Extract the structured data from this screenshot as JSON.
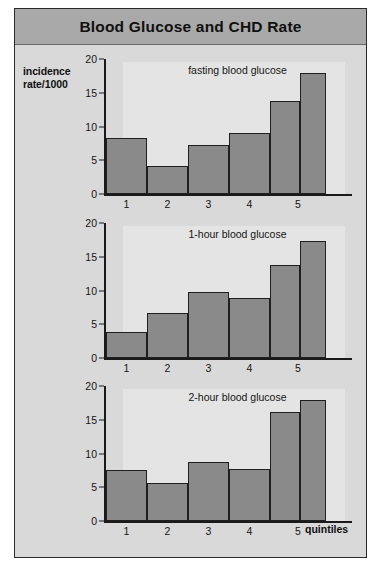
{
  "header": {
    "title": "Blood Glucose and CHD Rate"
  },
  "axis": {
    "y_label_line1": "incidence",
    "y_label_line2": "rate/1000",
    "x_label": "quintiles"
  },
  "chart_data": [
    {
      "type": "bar",
      "title": "fasting blood glucose",
      "categories": [
        "1",
        "2",
        "3",
        "4",
        "5a",
        "5b"
      ],
      "tick_labels": [
        "1",
        "2",
        "3",
        "4",
        "5"
      ],
      "values": [
        8.3,
        4.1,
        7.2,
        9.1,
        13.8,
        17.9
      ],
      "xlabel": "quintiles",
      "ylabel": "incidence rate/1000",
      "ylim": [
        0,
        20
      ],
      "yticks": [
        0,
        5,
        10,
        15,
        20
      ],
      "grid": false,
      "legend": "none"
    },
    {
      "type": "bar",
      "title": "1-hour blood glucose",
      "categories": [
        "1",
        "2",
        "3",
        "4",
        "5a",
        "5b"
      ],
      "tick_labels": [
        "1",
        "2",
        "3",
        "4",
        "5"
      ],
      "values": [
        3.9,
        6.6,
        9.8,
        8.9,
        13.8,
        17.3
      ],
      "xlabel": "quintiles",
      "ylabel": "incidence rate/1000",
      "ylim": [
        0,
        20
      ],
      "yticks": [
        0,
        5,
        10,
        15,
        20
      ],
      "grid": false,
      "legend": "none"
    },
    {
      "type": "bar",
      "title": "2-hour blood glucose",
      "categories": [
        "1",
        "2",
        "3",
        "4",
        "5a",
        "5b"
      ],
      "tick_labels": [
        "1",
        "2",
        "3",
        "4",
        "5"
      ],
      "values": [
        7.5,
        5.6,
        8.7,
        7.7,
        16.2,
        18.0
      ],
      "xlabel": "quintiles",
      "ylabel": "incidence rate/1000",
      "ylim": [
        0,
        20
      ],
      "yticks": [
        0,
        5,
        10,
        15,
        20
      ],
      "grid": false,
      "legend": "none"
    }
  ],
  "colors": {
    "bar_fill": "#8a8a8a",
    "bar_stroke": "#1f1f1f",
    "title_bar": "#a9a9a9",
    "figure_bg": "#d9d9d9",
    "plot_bg": "#e4e4e4"
  }
}
